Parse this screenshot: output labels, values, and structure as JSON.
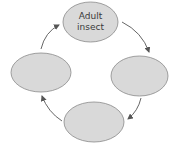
{
  "diagram": {
    "type": "life-cycle",
    "colors": {
      "ellipse_fill": "#d9d9d9",
      "ellipse_stroke": "#8a8a8a",
      "arrow": "#555555",
      "text": "#3a3a3a",
      "background": "#ffffff"
    },
    "stages": [
      {
        "id": "top",
        "label": "Adult\ninsect",
        "cx": 90.5,
        "cy": 22,
        "rx": 27.5,
        "ry": 20
      },
      {
        "id": "right",
        "label": "",
        "cx": 139.5,
        "cy": 76,
        "rx": 28.5,
        "ry": 20
      },
      {
        "id": "bottom",
        "label": "",
        "cx": 94,
        "cy": 122,
        "rx": 30,
        "ry": 20
      },
      {
        "id": "left",
        "label": "",
        "cx": 41,
        "cy": 72.5,
        "rx": 30,
        "ry": 19.5
      }
    ],
    "arrows": [
      {
        "from": "top",
        "to": "right",
        "direction": "clockwise"
      },
      {
        "from": "right",
        "to": "bottom",
        "direction": "clockwise"
      },
      {
        "from": "bottom",
        "to": "left",
        "direction": "clockwise"
      },
      {
        "from": "left",
        "to": "top",
        "direction": "clockwise"
      }
    ]
  }
}
